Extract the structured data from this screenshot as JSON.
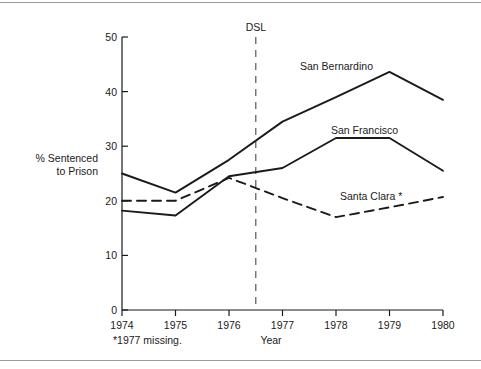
{
  "figure": {
    "background_color": "#ffffff",
    "ink_color": "#1a1a1a",
    "frame_color": "#9a9a9a"
  },
  "chart_data": {
    "type": "line",
    "title": "",
    "xlabel": "Year",
    "ylabel": "% Sentenced to Prison",
    "ylabel_line1": "% Sentenced",
    "ylabel_line2": "to Prison",
    "x": [
      1974,
      1975,
      1976,
      1977,
      1978,
      1979,
      1980
    ],
    "categories": [
      "1974",
      "1975",
      "1976",
      "1977",
      "1978",
      "1979",
      "1980"
    ],
    "xlim": [
      1974,
      1980
    ],
    "ylim": [
      0,
      50
    ],
    "yticks": [
      0,
      10,
      20,
      30,
      40,
      50
    ],
    "ytick_labels": [
      "0",
      "10",
      "20",
      "30",
      "40",
      "50"
    ],
    "xticks": [
      1974,
      1975,
      1976,
      1977,
      1978,
      1979,
      1980
    ],
    "xtick_labels": [
      "1974",
      "1975",
      "1976",
      "1977",
      "1978",
      "1979",
      "1980"
    ],
    "grid": false,
    "legend_position": "inline-labels",
    "series": [
      {
        "name": "San Bernardino",
        "style": "solid",
        "label": "San Bernardino",
        "values": [
          25.0,
          21.5,
          27.5,
          34.5,
          39.0,
          43.6,
          38.5
        ]
      },
      {
        "name": "San Francisco",
        "style": "solid",
        "label": "San Francisco",
        "values": [
          18.2,
          17.3,
          24.5,
          26.0,
          31.5,
          31.5,
          25.5
        ]
      },
      {
        "name": "Santa Clara",
        "style": "dashed",
        "label": "Santa Clara *",
        "values": [
          20.0,
          20.0,
          24.2,
          20.5,
          17.0,
          18.8,
          20.7
        ]
      }
    ],
    "annotations": [
      {
        "name": "dsl-marker",
        "label": "DSL",
        "x": 1976.5,
        "style": "dashed-vertical"
      }
    ],
    "footnote": "*1977 missing."
  }
}
